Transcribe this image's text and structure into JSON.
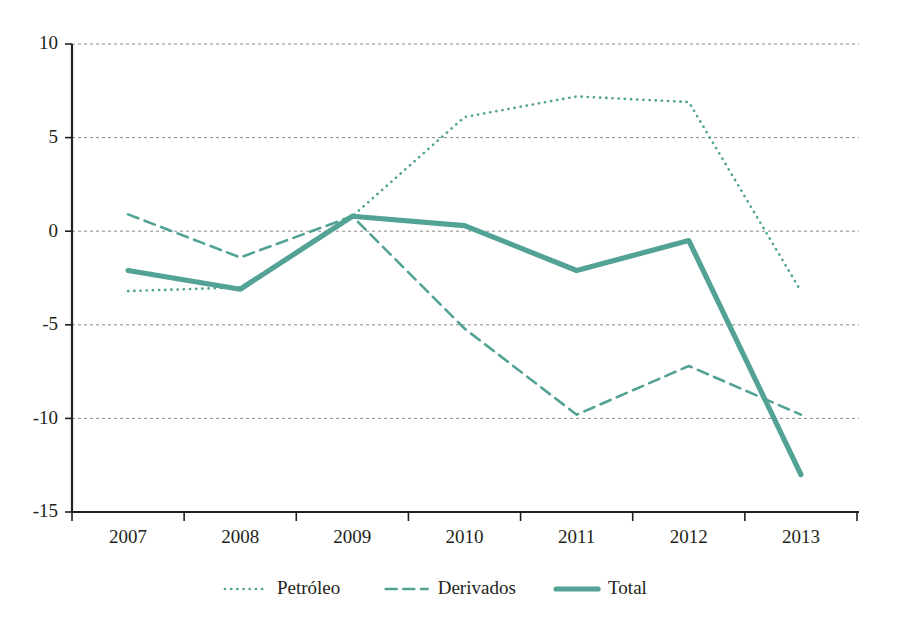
{
  "chart_data": {
    "type": "line",
    "title": "",
    "subtitle": "",
    "xlabel": "",
    "ylabel": "",
    "categories": [
      "2007",
      "2008",
      "2009",
      "2010",
      "2011",
      "2012",
      "2013"
    ],
    "x_tick_labels": [
      "2007",
      "2008",
      "2009",
      "2010",
      "2011",
      "2012",
      "2013"
    ],
    "y_tick_labels": [
      "10",
      "5",
      "0",
      "-5",
      "-10",
      "-15"
    ],
    "y_ticks": [
      10,
      5,
      0,
      -5,
      -10,
      -15
    ],
    "ylim": [
      -15,
      10
    ],
    "xlim": [
      2007,
      2013
    ],
    "grid": true,
    "grid_axis": "y",
    "legend_position": "bottom",
    "series": [
      {
        "name": "Petróleo",
        "style": "dotted",
        "color": "#52A295",
        "width": 2.6,
        "values": [
          -3.2,
          -3.0,
          0.8,
          6.1,
          7.2,
          6.9,
          -3.2
        ]
      },
      {
        "name": "Derivados",
        "style": "dashed",
        "color": "#52A295",
        "width": 2.6,
        "values": [
          0.9,
          -1.4,
          0.8,
          -5.2,
          -9.8,
          -7.2,
          -9.8
        ]
      },
      {
        "name": "Total",
        "style": "solid",
        "color": "#52A295",
        "width": 5.2,
        "values": [
          -2.1,
          -3.1,
          0.8,
          0.3,
          -2.1,
          -0.5,
          -13.0
        ]
      }
    ]
  },
  "legend": {
    "items": [
      {
        "label": "Petróleo",
        "style": "dotted"
      },
      {
        "label": "Derivados",
        "style": "dashed"
      },
      {
        "label": "Total",
        "style": "solid"
      }
    ]
  },
  "colors": {
    "series": "#52A295",
    "axis": "#231f20",
    "grid": "#8a8a8a",
    "background": "#ffffff"
  }
}
